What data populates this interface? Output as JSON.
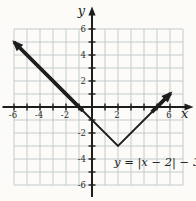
{
  "colors": {
    "background": "#fcfbf7",
    "grid": "#bdc5c8",
    "axis": "#1d1d1d",
    "curve": "#1d1d1d",
    "text": "#2c2c2c"
  },
  "chart_data": {
    "type": "line",
    "title": "",
    "equation": "y = |x - 2| - 3",
    "equation_label": "y = |x − 2| − 3",
    "xlabel": "x",
    "ylabel": "y",
    "xlim": [
      -7,
      7.5
    ],
    "ylim": [
      -7,
      7
    ],
    "grid": true,
    "grid_x_range": [
      -6,
      7
    ],
    "grid_y_range": [
      -6,
      6
    ],
    "x_ticks": [
      -6,
      -5,
      -4,
      -3,
      -2,
      -1,
      1,
      2,
      3,
      4,
      5,
      6
    ],
    "y_ticks": [
      -6,
      -5,
      -4,
      -3,
      -2,
      -1,
      1,
      2,
      3,
      4,
      5,
      6
    ],
    "x_tick_labels": [
      {
        "value": -6,
        "label": "-6"
      },
      {
        "value": -4,
        "label": "-4"
      },
      {
        "value": -2,
        "label": "-2"
      },
      {
        "value": 2,
        "label": "2"
      },
      {
        "value": 6,
        "label": "6"
      }
    ],
    "y_tick_labels": [
      {
        "value": 6,
        "label": "6"
      },
      {
        "value": 4,
        "label": "4"
      },
      {
        "value": 2,
        "label": "2"
      },
      {
        "value": -2,
        "label": "-2"
      },
      {
        "value": -4,
        "label": "-4"
      },
      {
        "value": -6,
        "label": "-6"
      }
    ],
    "vertex": [
      2,
      -3
    ],
    "x_intercepts": [
      [
        -1,
        0
      ],
      [
        5,
        0
      ]
    ],
    "y_intercept": [
      0,
      -1
    ],
    "series": [
      {
        "name": "y = |x - 2| - 3",
        "points": [
          [
            -6.3,
            5.3
          ],
          [
            2,
            -3
          ],
          [
            6.3,
            1.3
          ]
        ]
      }
    ],
    "curve_segments": [
      {
        "style": "thick",
        "points": [
          [
            -6,
            5
          ],
          [
            -0.7,
            -0.3
          ]
        ],
        "arrow_at": "start"
      },
      {
        "style": "thin",
        "points": [
          [
            -1,
            0
          ],
          [
            2,
            -3
          ],
          [
            5,
            0
          ]
        ]
      },
      {
        "style": "thick",
        "points": [
          [
            4.6,
            -0.4
          ],
          [
            6.05,
            1.05
          ]
        ],
        "arrow_at": "end"
      }
    ]
  }
}
